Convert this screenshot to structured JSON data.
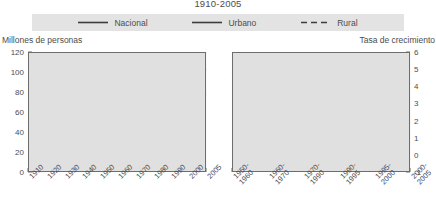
{
  "title": "1910-2005",
  "legend": {
    "items": [
      {
        "label": "Nacional",
        "style": "solid",
        "color": "#3d3d3d"
      },
      {
        "label": "Urbano",
        "style": "solid",
        "color": "#3d3d3d"
      },
      {
        "label": "Rural",
        "style": "dashed",
        "color": "#3d3d3d"
      }
    ]
  },
  "left_caption": "Millones de personas",
  "right_caption": "Tasa de crecimiento",
  "chart_data": [
    {
      "type": "line",
      "title": "Millones de personas",
      "xlabel": "",
      "ylabel": "Millones de personas",
      "ylim": [
        0,
        120
      ],
      "yticks": [
        0,
        20,
        40,
        60,
        80,
        100,
        120
      ],
      "grid": true,
      "legend_position": "top",
      "categories": [
        "1910",
        "1920",
        "1930",
        "1940",
        "1950",
        "1960",
        "1970",
        "1980",
        "1990",
        "2000",
        "2005"
      ],
      "series": [
        {
          "name": "Nacional",
          "style": "solid",
          "values": [
            15.2,
            14.3,
            16.6,
            19.7,
            25.8,
            35.0,
            48.2,
            66.8,
            81.2,
            97.5,
            103.3
          ]
        },
        {
          "name": "Urbano",
          "style": "solid",
          "values": [
            4.4,
            4.5,
            5.5,
            7.0,
            11.0,
            17.7,
            28.3,
            44.3,
            57.9,
            72.8,
            78.6
          ]
        },
        {
          "name": "Rural",
          "style": "dashed",
          "values": [
            10.8,
            9.8,
            11.1,
            12.8,
            14.8,
            17.3,
            19.9,
            22.5,
            23.3,
            24.7,
            24.7
          ]
        }
      ]
    },
    {
      "type": "line",
      "title": "Tasa de crecimiento",
      "xlabel": "",
      "ylabel": "Tasa de crecimiento",
      "ylim": [
        -1,
        6
      ],
      "yticks": [
        -1,
        0,
        1,
        2,
        3,
        4,
        5,
        6
      ],
      "grid": true,
      "legend_position": "top",
      "categories": [
        "1950-1960",
        "1960-1970",
        "1970-1990",
        "1990-1995",
        "1995-2000",
        "2000-2005"
      ],
      "series": [
        {
          "name": "Nacional",
          "style": "solid",
          "values": [
            3.1,
            3.4,
            2.6,
            2.0,
            1.6,
            1.3
          ]
        },
        {
          "name": "Urbano",
          "style": "solid",
          "values": [
            4.7,
            5.0,
            3.9,
            2.9,
            2.4,
            2.0
          ]
        },
        {
          "name": "Rural",
          "style": "dashed",
          "values": [
            1.6,
            1.6,
            0.9,
            0.7,
            0.2,
            -0.3
          ]
        }
      ]
    }
  ]
}
